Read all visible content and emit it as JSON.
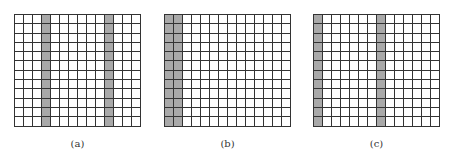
{
  "figure": {
    "panels": [
      {
        "label": "(a)",
        "cols": 14,
        "rows": 12,
        "shaded_columns": [
          4,
          11
        ],
        "left": 14
      },
      {
        "label": "(b)",
        "cols": 14,
        "rows": 12,
        "shaded_columns": [
          1,
          2
        ],
        "left": 164
      },
      {
        "label": "(c)",
        "cols": 14,
        "rows": 12,
        "shaded_columns": [
          1,
          8
        ],
        "left": 313
      }
    ],
    "colors": {
      "shaded": "#a9a9a9",
      "grid_line": "#333333",
      "background": "#ffffff"
    }
  }
}
